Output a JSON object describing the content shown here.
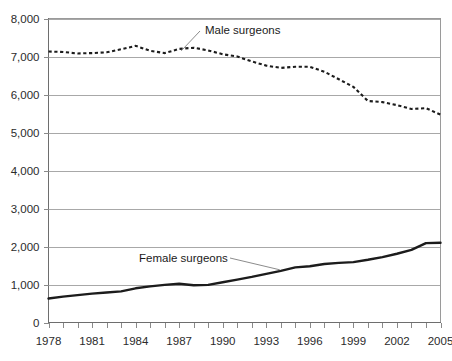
{
  "chart_data": {
    "type": "line",
    "title": "",
    "xlabel": "",
    "ylabel": "",
    "xlim": [
      1978,
      2005
    ],
    "ylim": [
      0,
      8000
    ],
    "grid": true,
    "legend_position": "inline-annotation",
    "y_ticks": [
      0,
      1000,
      2000,
      3000,
      4000,
      5000,
      6000,
      7000,
      8000
    ],
    "y_tick_labels": [
      "0",
      "1,000",
      "2,000",
      "3,000",
      "4,000",
      "5,000",
      "6,000",
      "7,000",
      "8,000"
    ],
    "x_ticks": [
      1978,
      1979,
      1980,
      1981,
      1982,
      1983,
      1984,
      1985,
      1986,
      1987,
      1988,
      1989,
      1990,
      1991,
      1992,
      1993,
      1994,
      1995,
      1996,
      1997,
      1998,
      1999,
      2000,
      2001,
      2002,
      2003,
      2004,
      2005
    ],
    "x_tick_labels": [
      "1978",
      "1981",
      "1984",
      "1987",
      "1990",
      "1993",
      "1996",
      "1999",
      "2002",
      "2005"
    ],
    "x_labeled_ticks": [
      1978,
      1981,
      1984,
      1987,
      1990,
      1993,
      1996,
      1999,
      2002,
      2005
    ],
    "x": [
      1978,
      1979,
      1980,
      1981,
      1982,
      1983,
      1984,
      1985,
      1986,
      1987,
      1988,
      1989,
      1990,
      1991,
      1992,
      1993,
      1994,
      1995,
      1996,
      1997,
      1998,
      1999,
      2000,
      2001,
      2002,
      2003,
      2004,
      2005
    ],
    "series": [
      {
        "name": "Male surgeons",
        "style": "dotted",
        "color": "#1c1c1c",
        "values": [
          7130,
          7120,
          7080,
          7090,
          7110,
          7190,
          7280,
          7150,
          7090,
          7200,
          7230,
          7160,
          7060,
          7000,
          6870,
          6760,
          6700,
          6730,
          6730,
          6600,
          6400,
          6200,
          5830,
          5800,
          5720,
          5620,
          5640,
          5470
        ]
      },
      {
        "name": "Female surgeons",
        "style": "solid",
        "color": "#1c1c1c",
        "values": [
          630,
          680,
          720,
          760,
          790,
          820,
          900,
          950,
          990,
          1020,
          980,
          990,
          1060,
          1130,
          1200,
          1280,
          1360,
          1450,
          1480,
          1540,
          1570,
          1590,
          1650,
          1720,
          1810,
          1910,
          2090,
          2100
        ]
      }
    ],
    "annotations": [
      {
        "text": "Male surgeons",
        "series": "Male surgeons"
      },
      {
        "text": "Female surgeons",
        "series": "Female surgeons"
      }
    ]
  }
}
